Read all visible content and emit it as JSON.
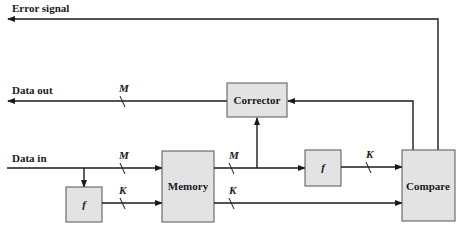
{
  "diagram": {
    "signals": {
      "error_signal": "Error signal",
      "data_out": "Data out",
      "data_in": "Data in"
    },
    "blocks": {
      "corrector": "Corrector",
      "memory": "Memory",
      "compare": "Compare",
      "f_input": "f",
      "f_output": "f"
    },
    "bus_widths": {
      "data_out": "M",
      "data_in": "M",
      "f_to_memory": "K",
      "memory_data_out": "M",
      "memory_check_out": "K",
      "f_to_compare": "K"
    },
    "colors": {
      "block_fill": "#e3e3e3",
      "line": "#1a1a1a"
    }
  }
}
